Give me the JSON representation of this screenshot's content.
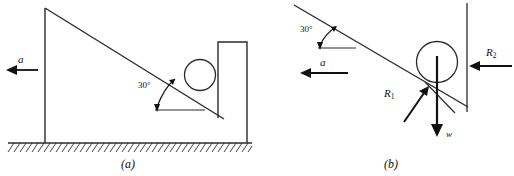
{
  "figure": {
    "panels": [
      {
        "key": "a",
        "caption": "(a)",
        "angle_label": "30°",
        "acceleration_label": "a",
        "acceleration_direction": "left",
        "ground": "hatched",
        "shapes": [
          "vertical-post",
          "inclined-plane",
          "circle",
          "vertical-wall",
          "ground-hatching"
        ]
      },
      {
        "key": "b",
        "caption": "(b)",
        "angle_label": "30°",
        "acceleration_label": "a",
        "acceleration_direction": "left",
        "forces": [
          {
            "name": "R1",
            "label": "R",
            "subscript": "1",
            "direction": "up-right-normal-to-incline"
          },
          {
            "name": "R2",
            "label": "R",
            "subscript": "2",
            "direction": "left-normal-to-wall"
          },
          {
            "name": "w",
            "label": "w",
            "subscript": "",
            "direction": "down"
          }
        ],
        "shapes": [
          "inclined-plane",
          "circle",
          "vertical-wall",
          "force-arrows"
        ]
      }
    ]
  },
  "colors": {
    "ink": "#111111",
    "line": "#2b2b2b",
    "background": "#ffffff"
  }
}
